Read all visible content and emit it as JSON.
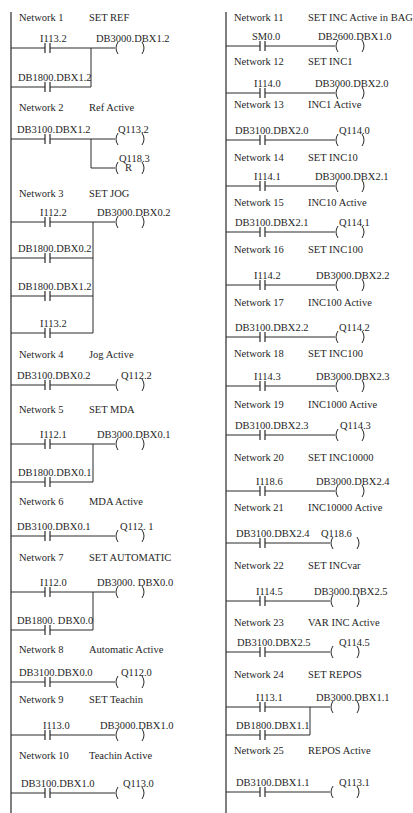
{
  "diagram_type": "ladder-logic",
  "colors": {
    "line": "#2a2a2a",
    "text": "#1f1f1f",
    "background": "#ffffff"
  },
  "columns": [
    {
      "rail_x": 11,
      "rail_y": [
        12,
        813
      ],
      "coil_x": 115,
      "networks": [
        {
          "number": "Network 1",
          "title": "SET REF",
          "header_y": 18,
          "rungs": [
            {
              "y": 48,
              "contact": "I113.2",
              "contact_label_x": 40
            },
            {
              "y": 87,
              "contact": "DB1800.DBX1.2",
              "contact_label_x": 18
            }
          ],
          "join_x": 91,
          "coils": [
            {
              "y": 48,
              "label": "DB3000.DBX1.2",
              "label_x": 96,
              "type": ""
            }
          ]
        },
        {
          "number": "Network 2",
          "title": "Ref Active",
          "header_y": 108,
          "rungs": [
            {
              "y": 139,
              "contact": "DB3100.DBX1.2",
              "contact_label_x": 17
            }
          ],
          "coils": [
            {
              "y": 139,
              "label": "Q113.2",
              "label_x": 118,
              "type": ""
            },
            {
              "y": 168,
              "label": "Q118.3",
              "label_x": 119,
              "type": "R",
              "branch_x": 91
            }
          ]
        },
        {
          "number": "Network 3",
          "title": "SET JOG",
          "header_y": 194,
          "rungs": [
            {
              "y": 222,
              "contact": "I112.2",
              "contact_label_x": 40
            },
            {
              "y": 258,
              "contact": "DB1800.DBX0.2",
              "contact_label_x": 18
            },
            {
              "y": 296,
              "contact": "DB1800.DBX1.2",
              "contact_label_x": 18
            },
            {
              "y": 333,
              "contact": "I113.2",
              "contact_label_x": 40
            }
          ],
          "join_x": 93,
          "coils": [
            {
              "y": 222,
              "label": "DB3000.DBX0.2",
              "label_x": 97,
              "type": ""
            }
          ]
        },
        {
          "number": "Network 4",
          "title": "Jog Active",
          "header_y": 355,
          "rungs": [
            {
              "y": 385,
              "contact": "DB3100.DBX0.2",
              "contact_label_x": 17
            }
          ],
          "coils": [
            {
              "y": 385,
              "label": "Q112.2",
              "label_x": 121,
              "type": ""
            }
          ]
        },
        {
          "number": "Network 5",
          "title": "SET MDA",
          "header_y": 410,
          "rungs": [
            {
              "y": 444,
              "contact": "I112.1",
              "contact_label_x": 40
            },
            {
              "y": 482,
              "contact": "DB1800.DBX0.1",
              "contact_label_x": 18
            }
          ],
          "join_x": 93,
          "coils": [
            {
              "y": 444,
              "label": "DB3000.DBX0.1",
              "label_x": 97,
              "type": ""
            }
          ]
        },
        {
          "number": "Network 6",
          "title": "MDA Active",
          "header_y": 502,
          "rungs": [
            {
              "y": 536,
              "contact": "DB3100.DBX0.1",
              "contact_label_x": 17
            }
          ],
          "coils": [
            {
              "y": 536,
              "label": "Q112. 1",
              "label_x": 120,
              "type": ""
            }
          ]
        },
        {
          "number": "Network 7",
          "title": "SET AUTOMATIC",
          "header_y": 558,
          "rungs": [
            {
              "y": 592,
              "contact": "I112.0",
              "contact_label_x": 40
            },
            {
              "y": 630,
              "contact": "DB1800. DBX0.0",
              "contact_label_x": 17
            }
          ],
          "join_x": 93,
          "coils": [
            {
              "y": 592,
              "label": "DB3000. DBX0.0",
              "label_x": 97,
              "type": ""
            }
          ]
        },
        {
          "number": "Network 8",
          "title": "Automatic Active",
          "header_y": 650,
          "rungs": [
            {
              "y": 682,
              "contact": "DB3100.DBX0.0",
              "contact_label_x": 19
            }
          ],
          "coils": [
            {
              "y": 682,
              "label": "Q112.0",
              "label_x": 121,
              "type": ""
            }
          ]
        },
        {
          "number": "Network 9",
          "title": "SET Teachin",
          "header_y": 700,
          "rungs": [
            {
              "y": 735,
              "contact": "I113.0",
              "contact_label_x": 43
            }
          ],
          "coils": [
            {
              "y": 735,
              "label": "DB3000.DBX1.0",
              "label_x": 100,
              "type": ""
            }
          ]
        },
        {
          "number": "Network 10",
          "title": "Teachin Active",
          "header_y": 756,
          "rungs": [
            {
              "y": 793,
              "contact": "DB3100.DBX1.0",
              "contact_label_x": 21
            }
          ],
          "coils": [
            {
              "y": 793,
              "label": "Q113.0",
              "label_x": 123,
              "type": ""
            }
          ]
        }
      ]
    },
    {
      "rail_x": 226,
      "rail_y": [
        12,
        813
      ],
      "coil_x": 335,
      "networks": [
        {
          "number": "Network 11",
          "title": "SET INC Active in BAG",
          "header_y": 18,
          "rungs": [
            {
              "y": 46,
              "contact": "SM0.0",
              "contact_label_x": 252
            }
          ],
          "coils": [
            {
              "y": 46,
              "label": "DB2600.DBX1.0",
              "label_x": 318,
              "type": ""
            }
          ]
        },
        {
          "number": "Network 12",
          "title": "SET INC1",
          "header_y": 62,
          "rungs": [
            {
              "y": 93,
              "contact": "I114.0",
              "contact_label_x": 254
            }
          ],
          "coils": [
            {
              "y": 93,
              "label": "DB3000.DBX2.0",
              "label_x": 315,
              "type": ""
            }
          ]
        },
        {
          "number": "Network 13",
          "title": "INC1 Active",
          "header_y": 105,
          "rungs": [
            {
              "y": 140,
              "contact": "DB3100.DBX2.0",
              "contact_label_x": 235
            }
          ],
          "coils": [
            {
              "y": 140,
              "label": "Q114.0",
              "label_x": 339,
              "type": ""
            }
          ]
        },
        {
          "number": "Network 14",
          "title": "SET INC10",
          "header_y": 158,
          "rungs": [
            {
              "y": 186,
              "contact": "I114.1",
              "contact_label_x": 254
            }
          ],
          "coils": [
            {
              "y": 186,
              "label": "DB3000.DBX2.1",
              "label_x": 315,
              "type": ""
            }
          ]
        },
        {
          "number": "Network 15",
          "title": "INC10 Active",
          "header_y": 203,
          "rungs": [
            {
              "y": 232,
              "contact": "DB3100.DBX2.1",
              "contact_label_x": 235
            }
          ],
          "coils": [
            {
              "y": 232,
              "label": "Q114.1",
              "label_x": 339,
              "type": ""
            }
          ]
        },
        {
          "number": "Network 16",
          "title": "SET INC100",
          "header_y": 250,
          "rungs": [
            {
              "y": 285,
              "contact": "I114.2",
              "contact_label_x": 254
            }
          ],
          "coils": [
            {
              "y": 285,
              "label": "DB3000.DBX2.2",
              "label_x": 316,
              "type": ""
            }
          ]
        },
        {
          "number": "Network 17",
          "title": "INC100 Active",
          "header_y": 303,
          "rungs": [
            {
              "y": 337,
              "contact": "DB3100.DBX2.2",
              "contact_label_x": 235
            }
          ],
          "coils": [
            {
              "y": 337,
              "label": "Q114.2",
              "label_x": 339,
              "type": ""
            }
          ]
        },
        {
          "number": "Network 18",
          "title": "SET INC100",
          "header_y": 354,
          "rungs": [
            {
              "y": 386,
              "contact": "I114.3",
              "contact_label_x": 254
            }
          ],
          "coils": [
            {
              "y": 386,
              "label": "DB3000.DBX2.3",
              "label_x": 316,
              "type": ""
            }
          ]
        },
        {
          "number": "Network 19",
          "title": "INC1000 Active",
          "header_y": 405,
          "rungs": [
            {
              "y": 435,
              "contact": "DB3100.DBX2.3",
              "contact_label_x": 235
            }
          ],
          "coils": [
            {
              "y": 435,
              "label": "Q114.3",
              "label_x": 340,
              "type": ""
            }
          ]
        },
        {
          "number": "Network 20",
          "title": "SET INC10000",
          "header_y": 458,
          "rungs": [
            {
              "y": 491,
              "contact": "I118.6",
              "contact_label_x": 256
            }
          ],
          "coils": [
            {
              "y": 491,
              "label": "DB3000.DBX2.4",
              "label_x": 316,
              "type": ""
            }
          ]
        },
        {
          "number": "Network 21",
          "title": "INC10000 Active",
          "header_y": 508,
          "rungs": [
            {
              "y": 543,
              "contact": "DB3100.DBX2.4",
              "contact_label_x": 236
            }
          ],
          "coils": [
            {
              "y": 543,
              "label": "Q118.6",
              "label_x": 321,
              "coil_x": 330,
              "type": ""
            }
          ]
        },
        {
          "number": "Network 22",
          "title": "SET INCvar",
          "header_y": 566,
          "rungs": [
            {
              "y": 601,
              "contact": "I114.5",
              "contact_label_x": 256
            }
          ],
          "coils": [
            {
              "y": 601,
              "label": "DB3000.DBX2.5",
              "label_x": 314,
              "coil_x": 330,
              "type": ""
            }
          ]
        },
        {
          "number": "Network 23",
          "title": "VAR INC Active",
          "header_y": 623,
          "rungs": [
            {
              "y": 652,
              "contact": "DB3100.DBX2.5",
              "contact_label_x": 237
            }
          ],
          "coils": [
            {
              "y": 652,
              "label": "Q114.5",
              "label_x": 339,
              "coil_x": 330,
              "type": ""
            }
          ]
        },
        {
          "number": "Network 24",
          "title": "SET REPOS",
          "header_y": 675,
          "rungs": [
            {
              "y": 707,
              "contact": "I113.1",
              "contact_label_x": 256
            },
            {
              "y": 735,
              "contact": "DB1800.DBX1.1",
              "contact_label_x": 236
            }
          ],
          "join_x": 310,
          "coils": [
            {
              "y": 707,
              "label": "DB3000.DBX1.1",
              "label_x": 316,
              "coil_x": 330,
              "type": ""
            }
          ]
        },
        {
          "number": "Network 25",
          "title": "REPOS Active",
          "header_y": 751,
          "rungs": [
            {
              "y": 792,
              "contact": "DB3100.DBX1.1",
              "contact_label_x": 236
            }
          ],
          "coils": [
            {
              "y": 792,
              "label": "Q113.1",
              "label_x": 339,
              "coil_x": 330,
              "type": ""
            }
          ]
        }
      ]
    }
  ]
}
